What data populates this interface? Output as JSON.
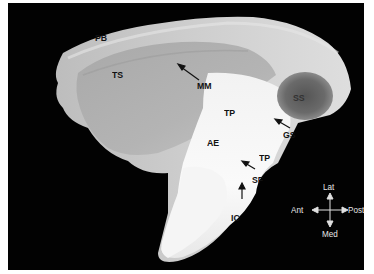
{
  "figure": {
    "background_color": "#020202",
    "specimen_color": "#d8d8d8",
    "labels": [
      {
        "id": "PB",
        "text": "PB"
      },
      {
        "id": "TS",
        "text": "TS"
      },
      {
        "id": "MM",
        "text": "MM"
      },
      {
        "id": "SS",
        "text": "SS"
      },
      {
        "id": "TP1",
        "text": "TP"
      },
      {
        "id": "GS",
        "text": "GS"
      },
      {
        "id": "AE",
        "text": "AE"
      },
      {
        "id": "TP2",
        "text": "TP"
      },
      {
        "id": "SF",
        "text": "SF"
      },
      {
        "id": "IC",
        "text": "IC"
      }
    ],
    "compass": {
      "up": "Lat",
      "down": "Med",
      "left": "Ant",
      "right": "Post"
    }
  }
}
